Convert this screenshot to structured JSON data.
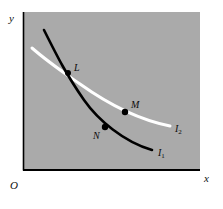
{
  "figure": {
    "type": "indifference-curve-diagram",
    "panel": {
      "fill_color": "#a9a9a9",
      "left": 23,
      "top": 12,
      "right": 200,
      "bottom": 170
    },
    "axes": {
      "color": "#000000",
      "y_label": "y",
      "x_label": "x",
      "origin_label": "O"
    },
    "curves": [
      {
        "id": "I1",
        "label": "I",
        "subscript": "1",
        "color": "#000000",
        "width": 2.6,
        "path": "M 44,30 C 58,58 66,74 84,100 C 98,120 124,142 152,150"
      },
      {
        "id": "I2",
        "label": "I",
        "subscript": "2",
        "color": "#ffffff",
        "width": 3.0,
        "path": "M 32,48 C 48,62 60,70 80,84 C 108,104 140,120 170,126"
      }
    ],
    "points": [
      {
        "id": "L",
        "label": "L",
        "cx": 68,
        "cy": 73,
        "r": 3.0,
        "color": "#000000",
        "label_x": 74,
        "label_y": 63
      },
      {
        "id": "M",
        "label": "M",
        "cx": 125,
        "cy": 112,
        "r": 3.2,
        "color": "#000000",
        "label_x": 131,
        "label_y": 100
      },
      {
        "id": "N",
        "label": "N",
        "cx": 105,
        "cy": 127,
        "r": 3.2,
        "color": "#000000",
        "label_x": 93,
        "label_y": 131
      }
    ],
    "curve_labels": [
      {
        "id": "I2",
        "x": 175,
        "y": 124
      },
      {
        "id": "I1",
        "x": 158,
        "y": 148
      }
    ],
    "axis_label_positions": {
      "y": {
        "x": 9,
        "y": 13
      },
      "x": {
        "x": 204,
        "y": 173
      },
      "O": {
        "x": 10,
        "y": 180
      }
    }
  },
  "chart_data": {
    "type": "line",
    "title": "",
    "xlabel": "x",
    "ylabel": "y",
    "grid": false,
    "legend": "inline-curve-labels",
    "series": [
      {
        "name": "I1",
        "color": "#000000",
        "description": "steeper convex indifference curve passing through L and N",
        "points": [
          [
            44,
            30
          ],
          [
            56,
            55
          ],
          [
            68,
            73
          ],
          [
            84,
            100
          ],
          [
            105,
            127
          ],
          [
            128,
            142
          ],
          [
            152,
            150
          ]
        ]
      },
      {
        "name": "I2",
        "color": "#ffffff",
        "description": "flatter convex indifference curve passing through L and M",
        "points": [
          [
            32,
            48
          ],
          [
            50,
            63
          ],
          [
            68,
            73
          ],
          [
            90,
            89
          ],
          [
            125,
            112
          ],
          [
            150,
            121
          ],
          [
            170,
            126
          ]
        ]
      }
    ],
    "annotations": [
      {
        "label": "L",
        "x": 68,
        "y": 73,
        "note": "intersection of I1 and I2"
      },
      {
        "label": "M",
        "x": 125,
        "y": 112,
        "note": "point on I2"
      },
      {
        "label": "N",
        "x": 105,
        "y": 127,
        "note": "point on I1"
      }
    ]
  }
}
